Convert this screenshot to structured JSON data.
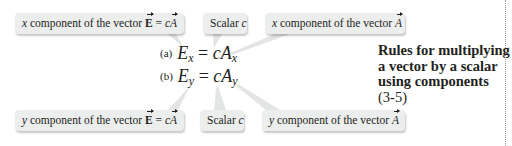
{
  "top_callouts": [
    {
      "prefix": "x",
      "text": " component of the vector ",
      "vector": "E",
      "equals": " = ",
      "scalar": "c",
      "vector2": "A"
    },
    {
      "label": "Scalar ",
      "scalar": "c"
    },
    {
      "prefix": "x",
      "text": " component of the vector ",
      "vector": "A"
    }
  ],
  "bottom_callouts": [
    {
      "prefix": "y",
      "text": " component of the vector ",
      "vector": "E",
      "equals": " = ",
      "scalar": "c",
      "vector2": "A"
    },
    {
      "label": "Scalar ",
      "scalar": "c"
    },
    {
      "prefix": "y",
      "text": " component of the vector ",
      "vector": "A"
    }
  ],
  "equations": [
    {
      "label": "(a)",
      "lhs": "E",
      "lhs_sub": "x",
      "equals": " = ",
      "scalar": "c",
      "rhs": "A",
      "rhs_sub": "x"
    },
    {
      "label": "(b)",
      "lhs": "E",
      "lhs_sub": "y",
      "equals": " = ",
      "scalar": "c",
      "rhs": "A",
      "rhs_sub": "y"
    }
  ],
  "caption": {
    "lines": [
      "Rules for multiplying",
      "a vector by a scalar",
      "using components"
    ],
    "number": "(3-5)"
  },
  "colors": {
    "bubble_bg": "#eceded",
    "text": "#231f20",
    "leader": "#c8caca"
  }
}
